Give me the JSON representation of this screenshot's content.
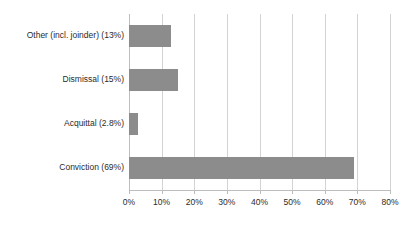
{
  "chart_data": {
    "type": "bar",
    "orientation": "horizontal",
    "title": "",
    "subtitle": "",
    "xlabel": "",
    "ylabel": "",
    "categories": [
      "Other (incl. joinder) (13%)",
      "Dismissal (15%)",
      "Acquittal (2.8%)",
      "Conviction (69%)"
    ],
    "values": [
      13,
      15,
      2.8,
      69
    ],
    "value_unit": "%",
    "xlim": [
      0,
      80
    ],
    "xticks": [
      0,
      10,
      20,
      30,
      40,
      50,
      60,
      70,
      80
    ],
    "xtick_labels": [
      "0%",
      "10%",
      "20%",
      "30%",
      "40%",
      "50%",
      "60%",
      "70%",
      "80%"
    ],
    "grid": true,
    "grid_axis": "x",
    "legend": false,
    "legend_position": "none",
    "bar_color": "#8c8c8c",
    "gridline_color": "#d3d3d3",
    "axis_color": "#bdbdbd",
    "background_color": "#ffffff",
    "text_color": "#2b2b2b"
  }
}
